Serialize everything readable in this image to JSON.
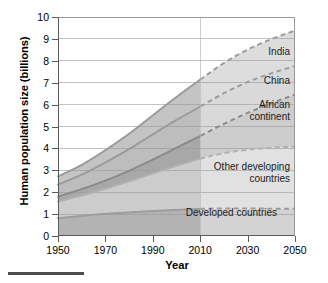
{
  "chart_data": {
    "type": "area",
    "title": "",
    "subtitle": "",
    "xlabel": "Year",
    "ylabel": "Human population size (billions)",
    "xlim": [
      1950,
      2050
    ],
    "ylim": [
      0,
      10
    ],
    "grid": true,
    "grid_axis": "y",
    "legend_position": "inline-right",
    "stacked": true,
    "projection_start_year": 2010,
    "note": "Solid lines = historical data up to 2010; dashed lines = projection 2010-2050",
    "x": [
      1950,
      1960,
      1970,
      1980,
      1990,
      2000,
      2010,
      2020,
      2030,
      2040,
      2050
    ],
    "xticks": [
      1950,
      1970,
      1990,
      2010,
      2030,
      2050
    ],
    "xticklabels": [
      "1950",
      "1970",
      "1990",
      "2010",
      "2030",
      "2050"
    ],
    "yticks": [
      0,
      1,
      2,
      3,
      4,
      5,
      6,
      7,
      8,
      9,
      10
    ],
    "yticklabels": [
      "0",
      "1",
      "2",
      "3",
      "4",
      "5",
      "6",
      "7",
      "8",
      "9",
      "10"
    ],
    "series": [
      {
        "name": "Developed countries",
        "label": "Developed countries",
        "color": "#b3b3b3",
        "line_color": "#9c9c9c",
        "values": [
          0.81,
          0.92,
          1.01,
          1.08,
          1.14,
          1.19,
          1.24,
          1.26,
          1.26,
          1.25,
          1.24
        ],
        "cumulative": [
          0.81,
          0.92,
          1.01,
          1.08,
          1.14,
          1.19,
          1.24,
          1.26,
          1.26,
          1.25,
          1.24
        ]
      },
      {
        "name": "Other developing countries",
        "label": "Other developing\ncountries",
        "color": "#cccccc",
        "line_color": "#b0b0b0",
        "values": [
          0.76,
          0.93,
          1.15,
          1.42,
          1.72,
          2.02,
          2.29,
          2.52,
          2.68,
          2.78,
          2.84
        ],
        "cumulative": [
          1.57,
          1.85,
          2.16,
          2.5,
          2.86,
          3.21,
          3.53,
          3.78,
          3.94,
          4.03,
          4.08
        ]
      },
      {
        "name": "African continent",
        "label": "African\ncontinent",
        "color": "#a8a8a8",
        "line_color": "#8a8a8a",
        "values": [
          0.23,
          0.29,
          0.37,
          0.48,
          0.63,
          0.82,
          1.04,
          1.34,
          1.68,
          2.03,
          2.38
        ],
        "cumulative": [
          1.8,
          2.14,
          2.53,
          2.98,
          3.49,
          4.03,
          4.57,
          5.12,
          5.62,
          6.06,
          6.46
        ]
      },
      {
        "name": "China",
        "label": "China",
        "color": "#bdbdbd",
        "line_color": "#9a9a9a",
        "values": [
          0.55,
          0.66,
          0.83,
          0.99,
          1.15,
          1.27,
          1.34,
          1.4,
          1.41,
          1.37,
          1.3
        ],
        "cumulative": [
          2.35,
          2.8,
          3.36,
          3.97,
          4.64,
          5.3,
          5.91,
          6.52,
          7.03,
          7.43,
          7.76
        ]
      },
      {
        "name": "India",
        "label": "India",
        "color": "#c4c4c4",
        "line_color": "#9a9a9a",
        "values": [
          0.37,
          0.45,
          0.56,
          0.7,
          0.87,
          1.05,
          1.23,
          1.38,
          1.48,
          1.56,
          1.62
        ],
        "cumulative": [
          2.72,
          3.25,
          3.92,
          4.67,
          5.51,
          6.35,
          7.14,
          7.9,
          8.51,
          8.99,
          9.38
        ]
      }
    ]
  },
  "decoration": {
    "bottom_rule": ""
  }
}
